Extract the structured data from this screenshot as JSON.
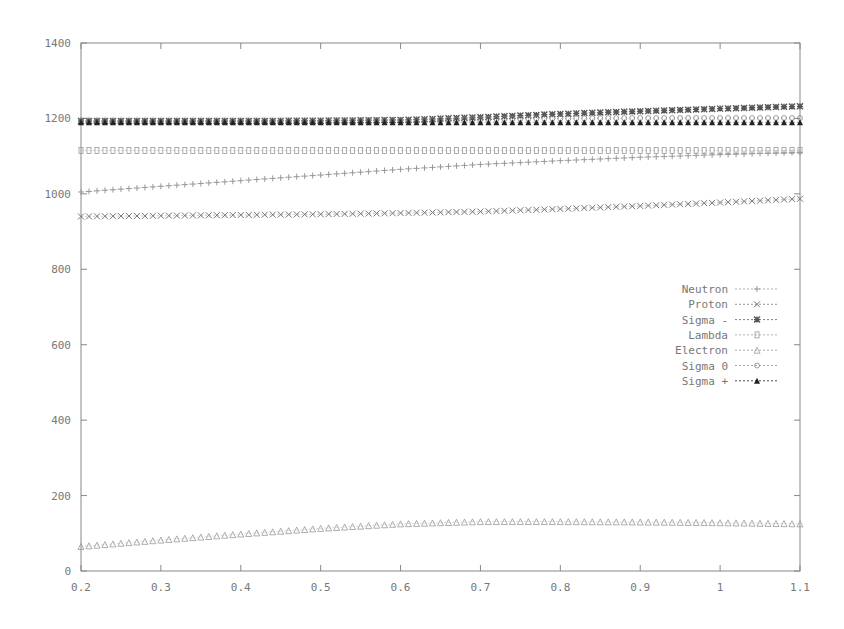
{
  "chart_data": {
    "type": "line",
    "title": "",
    "xlabel": "",
    "ylabel": "",
    "xlim": [
      0.2,
      1.1
    ],
    "ylim": [
      0,
      1400
    ],
    "grid": false,
    "legend_position": "right-middle",
    "x_ticks": [
      "0.2",
      "0.3",
      "0.4",
      "0.5",
      "0.6",
      "0.7",
      "0.8",
      "0.9",
      "1",
      "1.1"
    ],
    "y_ticks": [
      "0",
      "200",
      "400",
      "600",
      "800",
      "1000",
      "1200",
      "1400"
    ],
    "x": [
      0.2,
      0.3,
      0.4,
      0.5,
      0.6,
      0.7,
      0.8,
      0.9,
      1.0,
      1.1
    ],
    "series": [
      {
        "name": "Neutron",
        "marker": "+",
        "color": "#999999",
        "values": [
          1005,
          1020,
          1035,
          1050,
          1065,
          1078,
          1088,
          1097,
          1104,
          1110
        ]
      },
      {
        "name": "Proton",
        "marker": "x",
        "color": "#777777",
        "values": [
          940,
          942,
          944,
          946,
          949,
          953,
          960,
          968,
          977,
          987
        ]
      },
      {
        "name": "Sigma -",
        "marker": "*",
        "color": "#555555",
        "values": [
          1193,
          1193,
          1193,
          1194,
          1196,
          1203,
          1212,
          1219,
          1226,
          1232
        ]
      },
      {
        "name": "Lambda",
        "marker": "square",
        "color": "#999999",
        "values": [
          1115,
          1115,
          1115,
          1115,
          1115,
          1115,
          1115,
          1115,
          1115,
          1115
        ]
      },
      {
        "name": "Electron",
        "marker": "triangle",
        "color": "#999999",
        "values": [
          65,
          82,
          98,
          113,
          125,
          131,
          131,
          130,
          128,
          125
        ]
      },
      {
        "name": "Sigma 0",
        "marker": "circle",
        "color": "#888888",
        "values": [
          1195,
          1195,
          1195,
          1195,
          1196,
          1198,
          1200,
          1201,
          1201,
          1201
        ]
      },
      {
        "name": "Sigma +",
        "marker": "filled-triangle",
        "color": "#222222",
        "values": [
          1190,
          1190,
          1190,
          1190,
          1190,
          1190,
          1190,
          1190,
          1190,
          1190
        ]
      }
    ]
  }
}
